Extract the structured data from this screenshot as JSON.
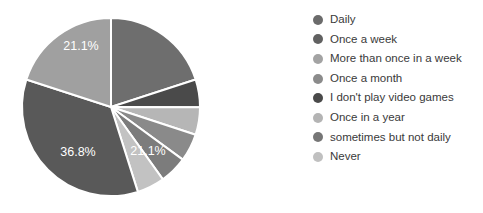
{
  "chart_data": {
    "type": "pie",
    "title": "",
    "categories": [
      "Daily",
      "Once a week",
      "More than once in a week",
      "Once a month",
      "I don't play video games",
      "Once in a year",
      "sometimes but not daily",
      "Never"
    ],
    "values": [
      36.8,
      21.1,
      21.1,
      5.3,
      5.3,
      5.3,
      5.3,
      5.3
    ],
    "unit": "%",
    "colors": [
      "#595959",
      "#6e6e6e",
      "#a0a0a0",
      "#8a8a8a",
      "#4a4a4a",
      "#b6b6b6",
      "#7c7c7c",
      "#c2c2c2"
    ],
    "slice_separator_color": "#ffffff",
    "data_labels": [
      {
        "text": "36.8%",
        "x": 78,
        "y": 153
      },
      {
        "text": "21.1%",
        "x": 148,
        "y": 152
      },
      {
        "text": "21.1%",
        "x": 81,
        "y": 47
      }
    ],
    "labels_shown": [
      "36.8%",
      "21.1%",
      "21.1%"
    ],
    "legend_position": "right",
    "grid": false,
    "geometry": {
      "cx": 111,
      "cy": 107,
      "r": 89,
      "start_angle_deg": -90
    },
    "slice_order_clockwise_from_top": [
      "Once a week",
      "I don't play video games",
      "Once in a year",
      "Once a month",
      "sometimes but not daily",
      "Never",
      "Daily",
      "More than once in a week"
    ]
  },
  "legend": {
    "items": [
      {
        "label": "Daily",
        "color": "#6b6b6b"
      },
      {
        "label": "Once a week",
        "color": "#616161"
      },
      {
        "label": "More than once in a week",
        "color": "#a3a3a3"
      },
      {
        "label": "Once a month",
        "color": "#8b8b8b"
      },
      {
        "label": "I don't play video games",
        "color": "#4a4a4a"
      },
      {
        "label": "Once in a year",
        "color": "#b4b4b4"
      },
      {
        "label": "sometimes but not daily",
        "color": "#767676"
      },
      {
        "label": "Never",
        "color": "#c0c0c0"
      }
    ]
  }
}
